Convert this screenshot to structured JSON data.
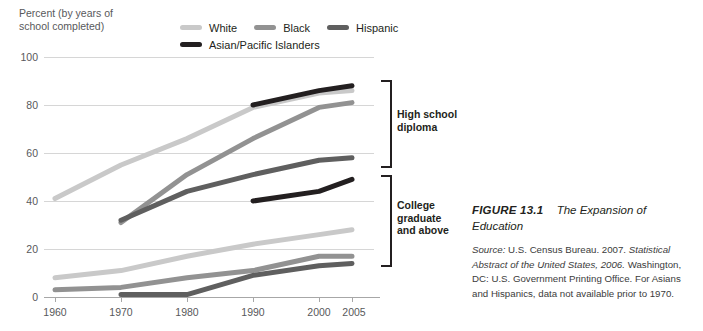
{
  "axis_title": "Percent (by years of\nschool completed)",
  "legend": {
    "items": [
      {
        "label": "White",
        "color": "#c9c9c9",
        "name": "legend-white"
      },
      {
        "label": "Black",
        "color": "#929292",
        "name": "legend-black"
      },
      {
        "label": "Hispanic",
        "color": "#5f5f5f",
        "name": "legend-hispanic"
      },
      {
        "label": "Asian/Pacific Islanders",
        "color": "#231f20",
        "name": "legend-asian"
      }
    ]
  },
  "brackets": [
    {
      "label": "High school\ndiploma",
      "name": "bracket-high-school"
    },
    {
      "label": "College\ngraduate\nand above",
      "name": "bracket-college"
    }
  ],
  "caption": {
    "figure_number": "FIGURE 13.1",
    "title": "The Expansion of Education",
    "source_prefix": "Source:",
    "source_line1": "U.S. Census Bureau. 2007.",
    "source_italic1": "Statistical",
    "source_italic2": "Abstract of the United States, 2006.",
    "source_line2": "Washington, DC:",
    "source_line3": "U.S. Government Printing Office. For Asians and",
    "source_line4": "Hispanics, data not available prior to 1970."
  },
  "chart_data": {
    "type": "line",
    "title": "The Expansion of Education",
    "xlabel": "",
    "ylabel": "Percent (by years of school completed)",
    "x": [
      1960,
      1970,
      1980,
      1990,
      2000,
      2005
    ],
    "xtick_labels": [
      "1960",
      "1970",
      "1980",
      "1990",
      "2000",
      "2005"
    ],
    "xlim": [
      1960,
      2005
    ],
    "ylim": [
      0,
      100
    ],
    "ytick_labels": [
      "0",
      "20",
      "40",
      "60",
      "80",
      "100"
    ],
    "yticks": [
      0,
      20,
      40,
      60,
      80,
      100
    ],
    "grid": true,
    "legend_position": "top",
    "groups": [
      {
        "group": "High school diploma",
        "series": [
          {
            "name": "White",
            "color": "#c9c9c9",
            "x": [
              1960,
              1970,
              1980,
              1990,
              2000,
              2005
            ],
            "values": [
              41,
              55,
              69,
              79,
              85,
              86
            ]
          },
          {
            "name": "Black",
            "color": "#929292",
            "x": [
              1970,
              1980,
              1990,
              2000,
              2005
            ],
            "values": [
              31,
              51,
              66,
              79,
              81
            ]
          },
          {
            "name": "Hispanic",
            "color": "#5f5f5f",
            "x": [
              1970,
              1980,
              1990,
              2000,
              2005
            ],
            "values": [
              32,
              44,
              51,
              57,
              58
            ]
          },
          {
            "name": "Asian/Pacific Islanders",
            "color": "#231f20",
            "x": [
              1990,
              2000,
              2005
            ],
            "values": [
              80,
              86,
              88
            ]
          }
        ]
      },
      {
        "group": "College graduate and above",
        "series": [
          {
            "name": "White",
            "color": "#c9c9c9",
            "x": [
              1960,
              1970,
              1980,
              1990,
              2000,
              2005
            ],
            "values": [
              8,
              11,
              17,
              22,
              26,
              28
            ]
          },
          {
            "name": "Black",
            "color": "#929292",
            "x": [
              1960,
              1970,
              1980,
              1990,
              2000,
              2005
            ],
            "values": [
              3,
              4,
              8,
              11,
              17,
              17
            ]
          },
          {
            "name": "Hispanic",
            "color": "#5f5f5f",
            "x": [
              1970,
              1980,
              1990,
              2000,
              2005
            ],
            "values": [
              1,
              1,
              9,
              13,
              14
            ]
          },
          {
            "name": "Asian/Pacific Islanders",
            "color": "#231f20",
            "x": [
              1990,
              2000,
              2005
            ],
            "values": [
              40,
              44,
              49
            ]
          }
        ]
      }
    ]
  }
}
